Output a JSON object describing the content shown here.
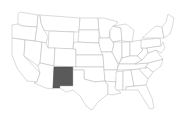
{
  "map": {
    "title": "United States",
    "highlighted_state": "New Mexico",
    "highlight_color": "#5a5a5a",
    "base_fill": "#ffffff",
    "border_color": "#b4b4b4",
    "states": [
      {
        "name": "Washington",
        "points": "18,14 20,12 38,15 37,27 22,26 18,24"
      },
      {
        "name": "Oregon",
        "points": "12,25 18,24 22,26 37,27 35,41 12,38"
      },
      {
        "name": "California",
        "points": "12,38 25,40 24,56 40,73 37,82 27,81 17,68 12,55"
      },
      {
        "name": "Nevada",
        "points": "25,40 35,41 42,42 40,63 38,66 24,56"
      },
      {
        "name": "Idaho",
        "points": "38,15 40,15 41,23 44,30 48,37 46,43 42,42 35,41 37,27"
      },
      {
        "name": "Montana",
        "points": "40,15 80,18 79,32 49,31 44,30 41,23"
      },
      {
        "name": "Wyoming",
        "points": "49,31 74,32 73,49 48,48"
      },
      {
        "name": "Utah",
        "points": "42,42 46,43 48,48 55,48 54,66 40,63"
      },
      {
        "name": "Arizona",
        "points": "40,63 54,66 53,89 46,88 34,83 37,82 40,73 38,66"
      },
      {
        "name": "Colorado",
        "points": "55,48 76,49 76,67 54,66"
      },
      {
        "name": "New Mexico",
        "points": "54,67 73,67 73,86 60,86 60,88 53,88",
        "highlighted": true
      },
      {
        "name": "North Dakota",
        "points": "80,18 98,18 99,30 79,30"
      },
      {
        "name": "South Dakota",
        "points": "79,30 99,30 99,43 78,42"
      },
      {
        "name": "Nebraska",
        "points": "74,42 99,43 103,55 76,55 76,49 73,49"
      },
      {
        "name": "Kansas",
        "points": "76,55 103,55 104,67 76,67"
      },
      {
        "name": "Oklahoma",
        "points": "73,67 104,67 105,81 95,82 84,79 84,70 73,70"
      },
      {
        "name": "Texas",
        "points": "73,70 84,70 84,79 95,82 105,81 108,85 108,94 98,102 92,110 86,106 80,96 73,90 66,92 60,88 60,86 73,86"
      },
      {
        "name": "Minnesota",
        "points": "98,18 104,18 118,22 110,30 109,38 100,38 99,30"
      },
      {
        "name": "Iowa",
        "points": "99,38 110,38 114,44 112,52 101,52 99,43"
      },
      {
        "name": "Missouri",
        "points": "101,52 112,52 114,56 118,64 117,70 104,70 103,55"
      },
      {
        "name": "Arkansas",
        "points": "104,70 117,70 116,82 107,82 105,81"
      },
      {
        "name": "Louisiana",
        "points": "105,81 116,82 115,88 121,93 112,95 108,94 108,85"
      },
      {
        "name": "Wisconsin",
        "points": "110,30 113,26 121,28 122,40 113,42 110,38"
      },
      {
        "name": "Illinois",
        "points": "113,42 122,42 122,56 119,64 114,56 112,52 114,44"
      },
      {
        "name": "Michigan",
        "points": "113,26 126,24 134,30 132,42 122,41 121,28"
      },
      {
        "name": "Indiana",
        "points": "122,42 130,42 130,56 122,58"
      },
      {
        "name": "Ohio",
        "points": "130,42 141,40 143,50 137,56 130,56"
      },
      {
        "name": "Kentucky",
        "points": "119,64 122,58 130,56 137,56 142,60 135,64"
      },
      {
        "name": "Tennessee",
        "points": "117,70 119,64 135,64 148,63 145,69"
      },
      {
        "name": "Mississippi",
        "points": "116,72 123,71 123,90 116,90 115,88 116,82"
      },
      {
        "name": "Alabama",
        "points": "123,71 131,70 134,86 126,87 126,90 123,90"
      },
      {
        "name": "Georgia",
        "points": "131,70 139,69 148,79 146,85 134,86"
      },
      {
        "name": "Florida",
        "points": "126,87 146,85 152,98 154,108 150,109 143,98 138,90 126,90"
      },
      {
        "name": "South Carolina",
        "points": "139,69 147,67 153,72 148,79"
      },
      {
        "name": "North Carolina",
        "points": "145,69 148,63 163,59 161,66 153,72 147,67"
      },
      {
        "name": "Virginia",
        "points": "142,60 148,53 156,50 161,57 163,59 148,63 135,64"
      },
      {
        "name": "West Virginia",
        "points": "141,48 147,48 148,53 142,60 137,56 143,50"
      },
      {
        "name": "Pennsylvania",
        "points": "141,40 160,38 161,46 147,48 141,48"
      },
      {
        "name": "New York",
        "points": "142,38 150,31 156,26 162,27 164,38 160,38"
      },
      {
        "name": "Maryland/Delaware/NJ",
        "points": "147,48 161,46 163,42 165,48 161,53 156,50 148,53"
      },
      {
        "name": "New England",
        "points": "162,27 166,22 168,14 174,18 172,28 170,34 164,38"
      }
    ]
  }
}
